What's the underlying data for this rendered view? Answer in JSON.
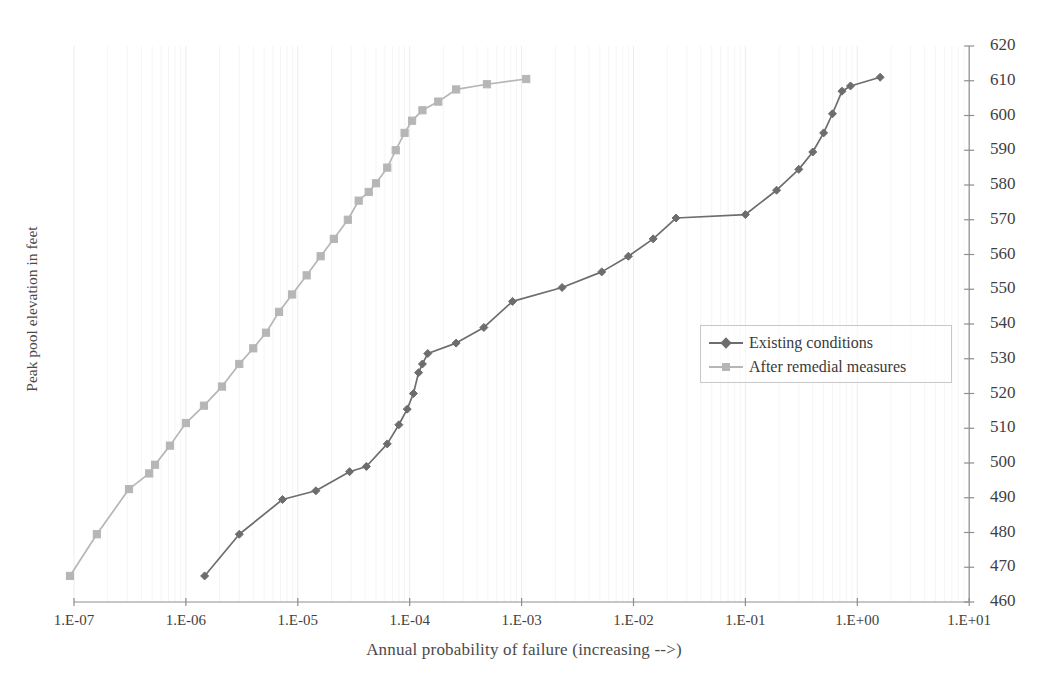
{
  "chart_data": {
    "type": "line",
    "title": "",
    "subtitle": "",
    "xlabel": "Annual probability of failure (increasing -->)",
    "ylabel": "Peak pool elevation in feet",
    "x_scale": "log",
    "xlim": [
      1e-07,
      10
    ],
    "ylim": [
      460,
      620
    ],
    "y_ticks": [
      460,
      470,
      480,
      490,
      500,
      510,
      520,
      530,
      540,
      550,
      560,
      570,
      580,
      590,
      600,
      610,
      620
    ],
    "y_tick_labels": [
      "460",
      "470",
      "480",
      "490",
      "500",
      "510",
      "520",
      "530",
      "540",
      "550",
      "560",
      "570",
      "580",
      "590",
      "600",
      "610",
      "620"
    ],
    "y_axis_position": "right",
    "x_ticks": [
      1e-07,
      1e-06,
      1e-05,
      0.0001,
      0.001,
      0.01,
      0.1,
      1,
      10
    ],
    "x_tick_labels": [
      "1.E-07",
      "1.E-06",
      "1.E-05",
      "1.E-04",
      "1.E-03",
      "1.E-02",
      "1.E-01",
      "1.E+00",
      "1.E+01"
    ],
    "grid": "minor-log-vertical-faint",
    "legend_position": "center-right",
    "series": [
      {
        "name": "Existing conditions",
        "color": "#6d6d6d",
        "marker": "diamond",
        "points": [
          [
            1.47e-06,
            467.5
          ],
          [
            3e-06,
            479.5
          ],
          [
            7.3e-06,
            489.5
          ],
          [
            1.45e-05,
            492.0
          ],
          [
            2.9e-05,
            497.5
          ],
          [
            4.1e-05,
            499.0
          ],
          [
            6.3e-05,
            505.5
          ],
          [
            8e-05,
            511.0
          ],
          [
            9.5e-05,
            515.5
          ],
          [
            0.000108,
            520.0
          ],
          [
            0.00012,
            526.0
          ],
          [
            0.00013,
            528.5
          ],
          [
            0.000145,
            531.5
          ],
          [
            0.00026,
            534.5
          ],
          [
            0.00046,
            539.0
          ],
          [
            0.00083,
            546.5
          ],
          [
            0.0023,
            550.5
          ],
          [
            0.0052,
            555.0
          ],
          [
            0.009,
            559.5
          ],
          [
            0.015,
            564.5
          ],
          [
            0.024,
            570.5
          ],
          [
            0.1,
            571.5
          ],
          [
            0.19,
            578.5
          ],
          [
            0.3,
            584.5
          ],
          [
            0.4,
            589.5
          ],
          [
            0.5,
            595.0
          ],
          [
            0.6,
            600.5
          ],
          [
            0.73,
            607.0
          ],
          [
            0.87,
            608.5
          ],
          [
            1.6,
            611.0
          ]
        ]
      },
      {
        "name": "After remedial measures",
        "color": "#b6b6b6",
        "marker": "square",
        "points": [
          [
            9.2e-08,
            467.5
          ],
          [
            1.6e-07,
            479.5
          ],
          [
            3.1e-07,
            492.5
          ],
          [
            4.7e-07,
            497.0
          ],
          [
            5.3e-07,
            499.5
          ],
          [
            7.2e-07,
            505.0
          ],
          [
            1e-06,
            511.5
          ],
          [
            1.45e-06,
            516.5
          ],
          [
            2.1e-06,
            522.0
          ],
          [
            3e-06,
            528.5
          ],
          [
            4e-06,
            533.0
          ],
          [
            5.2e-06,
            537.5
          ],
          [
            6.8e-06,
            543.5
          ],
          [
            8.9e-06,
            548.5
          ],
          [
            1.2e-05,
            554.0
          ],
          [
            1.6e-05,
            559.5
          ],
          [
            2.1e-05,
            564.5
          ],
          [
            2.8e-05,
            570.0
          ],
          [
            3.5e-05,
            575.5
          ],
          [
            4.3e-05,
            578.0
          ],
          [
            5e-05,
            580.5
          ],
          [
            6.3e-05,
            585.0
          ],
          [
            7.5e-05,
            590.0
          ],
          [
            9e-05,
            595.0
          ],
          [
            0.000105,
            598.5
          ],
          [
            0.00013,
            601.5
          ],
          [
            0.00018,
            604.0
          ],
          [
            0.00026,
            607.5
          ],
          [
            0.00049,
            609.0
          ],
          [
            0.0011,
            610.5
          ]
        ]
      }
    ]
  },
  "legend": {
    "items": [
      {
        "label": "Existing conditions",
        "color": "#6d6d6d",
        "marker": "diamond"
      },
      {
        "label": "After remedial measures",
        "color": "#b6b6b6",
        "marker": "square"
      }
    ]
  },
  "axes": {
    "x_title": "Annual probability of failure (increasing -->)",
    "y_title": "Peak pool elevation in feet"
  }
}
